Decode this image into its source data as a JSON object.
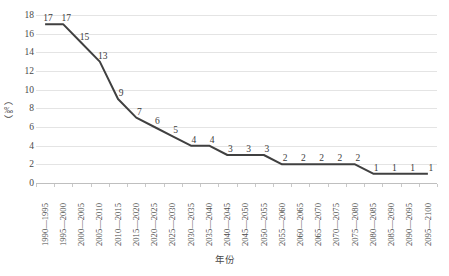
{
  "chart_data": {
    "type": "line",
    "title": "",
    "xlabel": "年份",
    "ylabel": "（‰）",
    "ylim": [
      0,
      18
    ],
    "ytick_step": 2,
    "yticks": [
      18,
      16,
      14,
      12,
      10,
      8,
      6,
      4,
      2,
      0
    ],
    "grid": true,
    "legend": "none",
    "line_color": "#404040",
    "line_width": 2,
    "data_labels": true,
    "categories": [
      "1990—1995",
      "1995—2000",
      "2000—2005",
      "2005—2010",
      "2010—2015",
      "2015—2020",
      "2020—2025",
      "2025—2030",
      "2030—2035",
      "2035—2040",
      "2040—2045",
      "2045—2050",
      "2050—2055",
      "2055—2060",
      "2060—2065",
      "2065—2070",
      "2070—2075",
      "2075—2080",
      "2080—2085",
      "2085—2090",
      "2090—2095",
      "2095—2100"
    ],
    "values": [
      17,
      17,
      15,
      13,
      9,
      7,
      6,
      5,
      4,
      4,
      3,
      3,
      3,
      2,
      2,
      2,
      2,
      2,
      1,
      1,
      1,
      1
    ]
  }
}
